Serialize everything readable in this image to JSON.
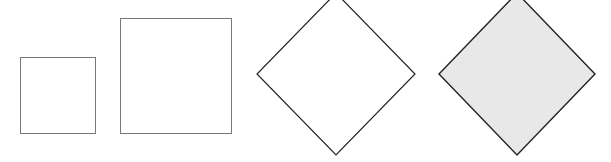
{
  "diagram": {
    "background": "#ffffff",
    "shapes": [
      {
        "id": "small-square",
        "type": "square",
        "x": 20.5,
        "y": 57.5,
        "width": 75,
        "height": 76,
        "fill": "#ffffff",
        "stroke": "#777777",
        "stroke_width": 1
      },
      {
        "id": "large-square",
        "type": "square",
        "x": 120.5,
        "y": 18.5,
        "width": 111,
        "height": 115,
        "fill": "#ffffff",
        "stroke": "#777777",
        "stroke_width": 1
      },
      {
        "id": "outline-diamond",
        "type": "diamond",
        "cx": 336,
        "cy": 74,
        "rx": 79,
        "ry": 81,
        "fill": "#ffffff",
        "stroke": "#222222",
        "stroke_width": 1.2
      },
      {
        "id": "filled-diamond",
        "type": "diamond",
        "cx": 517,
        "cy": 74,
        "rx": 78,
        "ry": 81,
        "fill": "#e8e8e8",
        "stroke": "#222222",
        "stroke_width": 1.4
      }
    ]
  }
}
